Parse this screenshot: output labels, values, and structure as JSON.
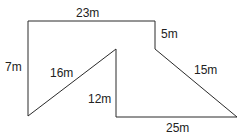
{
  "diagram": {
    "type": "compound-shape-perimeter",
    "stroke_color": "#2a2a2a",
    "background": "#ffffff",
    "vertices": [
      {
        "id": "top-left",
        "x": 28,
        "y": 21
      },
      {
        "id": "top-right",
        "x": 155,
        "y": 21
      },
      {
        "id": "step-inner",
        "x": 155,
        "y": 49
      },
      {
        "id": "bottom-right",
        "x": 237,
        "y": 117
      },
      {
        "id": "inner-bottom",
        "x": 116,
        "y": 117
      },
      {
        "id": "inner-peak",
        "x": 116,
        "y": 49
      },
      {
        "id": "bottom-left",
        "x": 28,
        "y": 116
      }
    ],
    "labels": {
      "top": "23m",
      "right_step": "5m",
      "right_slant": "15m",
      "bottom": "25m",
      "inner_vertical": "12m",
      "inner_slant": "16m",
      "left": "7m"
    }
  }
}
